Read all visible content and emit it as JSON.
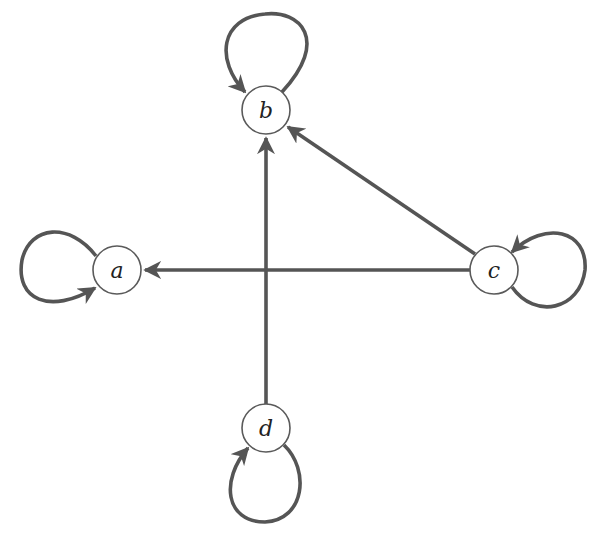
{
  "graph": {
    "type": "directed",
    "nodes": [
      {
        "id": "a",
        "label": "a",
        "x": 117,
        "y": 270
      },
      {
        "id": "b",
        "label": "b",
        "x": 266,
        "y": 110
      },
      {
        "id": "c",
        "label": "c",
        "x": 494,
        "y": 270
      },
      {
        "id": "d",
        "label": "d",
        "x": 266,
        "y": 428
      }
    ],
    "edges": [
      {
        "from": "a",
        "to": "a",
        "kind": "self-loop"
      },
      {
        "from": "b",
        "to": "b",
        "kind": "self-loop"
      },
      {
        "from": "c",
        "to": "c",
        "kind": "self-loop"
      },
      {
        "from": "d",
        "to": "d",
        "kind": "self-loop"
      },
      {
        "from": "c",
        "to": "a"
      },
      {
        "from": "c",
        "to": "b"
      },
      {
        "from": "d",
        "to": "b"
      }
    ],
    "colors": {
      "edge": "#555555",
      "node_stroke": "#5a5a5a",
      "node_fill": "#ffffff"
    }
  }
}
